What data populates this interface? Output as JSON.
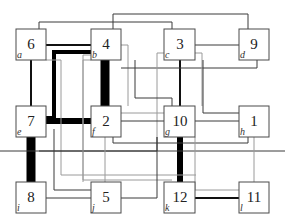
{
  "diagram": {
    "type": "facility-layout-flow-diagram",
    "nodes": [
      {
        "id": "6",
        "location": "a",
        "row": 0,
        "col": 0
      },
      {
        "id": "4",
        "location": "b",
        "row": 0,
        "col": 1
      },
      {
        "id": "3",
        "location": "c",
        "row": 0,
        "col": 2
      },
      {
        "id": "9",
        "location": "d",
        "row": 0,
        "col": 3
      },
      {
        "id": "7",
        "location": "e",
        "row": 1,
        "col": 0
      },
      {
        "id": "2",
        "location": "f",
        "row": 1,
        "col": 1
      },
      {
        "id": "10",
        "location": "g",
        "row": 1,
        "col": 2
      },
      {
        "id": "1",
        "location": "h",
        "row": 1,
        "col": 3
      },
      {
        "id": "8",
        "location": "i",
        "row": 2,
        "col": 0
      },
      {
        "id": "5",
        "location": "j",
        "row": 2,
        "col": 1
      },
      {
        "id": "12",
        "location": "k",
        "row": 2,
        "col": 2
      },
      {
        "id": "11",
        "location": "l",
        "row": 2,
        "col": 3
      }
    ],
    "edges": [
      {
        "from": "6",
        "to": "4",
        "weight": "heavy"
      },
      {
        "from": "6",
        "to": "3",
        "weight": "medium"
      },
      {
        "from": "6",
        "to": "7",
        "weight": "heavy"
      },
      {
        "from": "4",
        "to": "9",
        "weight": "medium"
      },
      {
        "from": "4",
        "to": "2",
        "weight": "very-heavy"
      },
      {
        "from": "4",
        "to": "7",
        "weight": "heavy"
      },
      {
        "from": "3",
        "to": "9",
        "weight": "medium"
      },
      {
        "from": "3",
        "to": "10",
        "weight": "medium"
      },
      {
        "from": "7",
        "to": "2",
        "weight": "very-heavy"
      },
      {
        "from": "7",
        "to": "8",
        "weight": "very-heavy"
      },
      {
        "from": "10",
        "to": "12",
        "weight": "very-heavy"
      },
      {
        "from": "12",
        "to": "11",
        "weight": "medium"
      },
      {
        "from": "2",
        "to": "10",
        "weight": "light"
      },
      {
        "from": "10",
        "to": "1",
        "weight": "light"
      },
      {
        "from": "1",
        "to": "11",
        "weight": "light"
      },
      {
        "from": "8",
        "to": "5",
        "weight": "light"
      },
      {
        "from": "5",
        "to": "12",
        "weight": "light"
      }
    ]
  }
}
